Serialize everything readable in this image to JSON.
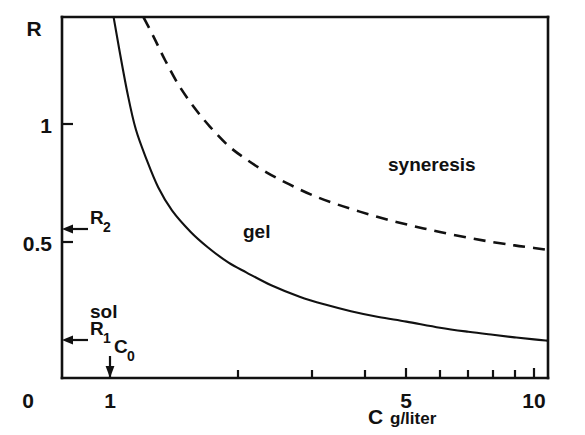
{
  "chart_data": {
    "type": "line",
    "title": "",
    "xlabel": "C  g/liter",
    "xlabel_symbol": "C",
    "xlabel_unit": "g/liter",
    "ylabel": "R",
    "xscale": "log",
    "yscale": "linear",
    "xlim": [
      0.88,
      11.2
    ],
    "ylim": [
      0,
      1.42
    ],
    "grid": false,
    "legend": "none",
    "xticks": [
      1,
      2,
      3,
      4,
      5,
      6,
      7,
      8,
      9,
      10
    ],
    "xtick_labels": [
      "1",
      "",
      "",
      "",
      "5",
      "",
      "",
      "",
      "",
      "10"
    ],
    "yticks": [
      0.5,
      1
    ],
    "ytick_labels": [
      "0.5",
      "1"
    ],
    "origin_label": "0",
    "series": [
      {
        "name": "sol-gel boundary",
        "style": "solid",
        "x": [
          1.02,
          1.05,
          1.1,
          1.15,
          1.22,
          1.3,
          1.4,
          1.55,
          1.7,
          1.9,
          2.1,
          2.4,
          2.8,
          3.2,
          3.7,
          4.3,
          5.0,
          6.0,
          7.0,
          8.0,
          9.0,
          10.0,
          10.9
        ],
        "y": [
          1.42,
          1.3,
          1.12,
          0.98,
          0.86,
          0.75,
          0.66,
          0.575,
          0.515,
          0.455,
          0.415,
          0.365,
          0.32,
          0.29,
          0.263,
          0.24,
          0.222,
          0.198,
          0.182,
          0.17,
          0.16,
          0.152,
          0.147
        ]
      },
      {
        "name": "gel-syneresis boundary",
        "style": "dashed",
        "x": [
          1.2,
          1.27,
          1.35,
          1.45,
          1.58,
          1.72,
          1.9,
          2.1,
          2.35,
          2.65,
          3.0,
          3.4,
          3.9,
          4.5,
          5.2,
          6.0,
          7.0,
          8.0,
          9.0,
          10.0,
          10.7
        ],
        "y": [
          1.42,
          1.34,
          1.25,
          1.155,
          1.065,
          0.99,
          0.915,
          0.86,
          0.808,
          0.762,
          0.72,
          0.686,
          0.654,
          0.624,
          0.598,
          0.575,
          0.552,
          0.535,
          0.522,
          0.512,
          0.505
        ]
      }
    ],
    "region_labels": [
      {
        "text": "sol",
        "x": 1.25,
        "y": 0.335
      },
      {
        "text": "gel",
        "x": 2.75,
        "y": 0.56
      },
      {
        "text": "syneresis",
        "x": 6.1,
        "y": 0.835
      }
    ],
    "annotations": [
      {
        "name": "R2",
        "symbol": "R",
        "subscript": "2",
        "axis": "y",
        "value": 0.555,
        "arrow": "left"
      },
      {
        "name": "R1",
        "symbol": "R",
        "subscript": "1",
        "axis": "y",
        "value": 0.135,
        "arrow": "left"
      },
      {
        "name": "C0",
        "symbol": "C",
        "subscript": "0",
        "axis": "x",
        "value": 1.0,
        "arrow": "down"
      }
    ]
  },
  "figure": {
    "axis_y_name": "R",
    "axis_x_symbol": "C",
    "axis_x_unit": "g/liter",
    "origin": "0",
    "ytick_05": "0.5",
    "ytick_1": "1",
    "xtick_1": "1",
    "xtick_5": "5",
    "xtick_10": "10",
    "label_sol": "sol",
    "label_gel": "gel",
    "label_syneresis": "syneresis",
    "marker_R2_symbol": "R",
    "marker_R2_sub": "2",
    "marker_R1_symbol": "R",
    "marker_R1_sub": "1",
    "marker_C0_symbol": "C",
    "marker_C0_sub": "0"
  },
  "colors": {
    "ink": "#111111",
    "background": "#ffffff"
  }
}
